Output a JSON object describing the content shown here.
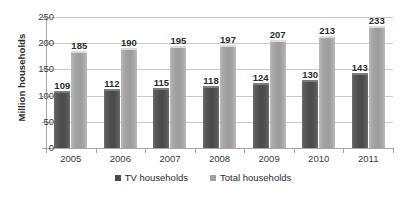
{
  "chart_data": {
    "type": "bar",
    "title": "",
    "xlabel": "",
    "ylabel": "Million households",
    "ylim": [
      0,
      250
    ],
    "yticks": [
      0,
      50,
      100,
      150,
      200,
      250
    ],
    "grid": true,
    "legend_position": "bottom",
    "categories": [
      "2005",
      "2006",
      "2007",
      "2008",
      "2009",
      "2010",
      "2011"
    ],
    "series": [
      {
        "name": "TV households",
        "color": "#4a4a4a",
        "values": [
          109,
          112,
          115,
          118,
          124,
          130,
          143
        ]
      },
      {
        "name": "Total households",
        "color": "#a2a2a2",
        "values": [
          185,
          190,
          195,
          197,
          207,
          213,
          233
        ]
      }
    ]
  }
}
